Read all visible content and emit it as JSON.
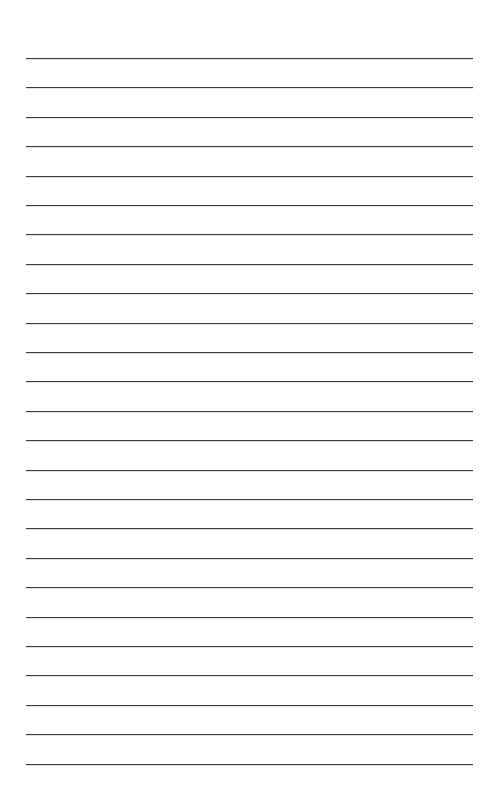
{
  "page": {
    "type": "lined-paper",
    "background_color": "#ffffff",
    "line_color": "#3a3a3a",
    "line_count": 25,
    "first_line_y": 58,
    "line_spacing": 29.4,
    "line_left": 26,
    "line_width": 447
  }
}
